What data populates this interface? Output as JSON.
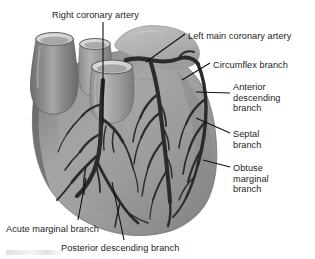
{
  "figure": {
    "type": "anatomical-illustration",
    "colors": {
      "background": "#ffffff",
      "heart_body": "#9b9b9b",
      "heart_body_light": "#b4b4b4",
      "heart_body_shadow": "#7d7d7d",
      "aorta": "#8a8a8a",
      "aorta_dark": "#6d6d6d",
      "vessel_lumen": "#d8d8d8",
      "atrial_appendage": "#b9b9b9",
      "coronary_artery": "#2a2a2a",
      "label_text": "#1d1d1d",
      "leader_line": "#111111"
    },
    "structures": [
      "aorta",
      "superior-vena-cava",
      "pulmonary-artery",
      "left-atrial-appendage",
      "right-ventricle",
      "left-ventricle"
    ]
  },
  "labels": [
    {
      "id": "right-coronary-artery",
      "text": "Right coronary artery",
      "x": 52,
      "y": 10,
      "align": "left"
    },
    {
      "id": "left-main-coronary-artery",
      "text": "Left main coronary artery",
      "x": 188,
      "y": 31,
      "align": "left"
    },
    {
      "id": "circumflex-branch",
      "text": "Circumflex branch",
      "x": 213,
      "y": 60,
      "align": "left"
    },
    {
      "id": "anterior-descending-branch",
      "text": "Anterior\ndescending\nbranch",
      "x": 233,
      "y": 82,
      "align": "left"
    },
    {
      "id": "septal-branch",
      "text": "Septal\nbranch",
      "x": 233,
      "y": 129,
      "align": "left"
    },
    {
      "id": "obtuse-marginal-branch",
      "text": "Obtuse\nmarginal\nbranch",
      "x": 233,
      "y": 163,
      "align": "left"
    },
    {
      "id": "acute-marginal-branch",
      "text": "Acute marginal branch",
      "x": 6,
      "y": 224,
      "align": "left"
    },
    {
      "id": "posterior-descending-branch",
      "text": "Posterior descending branch",
      "x": 61,
      "y": 243,
      "align": "left"
    }
  ]
}
